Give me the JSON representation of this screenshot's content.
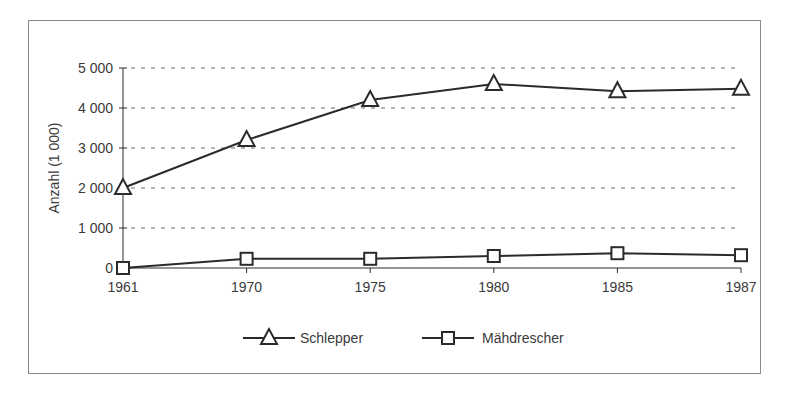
{
  "chart_data": {
    "type": "line",
    "title": "",
    "xlabel": "",
    "ylabel": "Anzahl (1 000)",
    "categories": [
      "1961",
      "1970",
      "1975",
      "1980",
      "1985",
      "1987"
    ],
    "series": [
      {
        "name": "Schlepper",
        "marker": "triangle",
        "values": [
          2000,
          3200,
          4200,
          4600,
          4420,
          4480
        ]
      },
      {
        "name": "Mähdrescher",
        "marker": "square",
        "values": [
          0,
          230,
          230,
          300,
          370,
          320
        ]
      }
    ],
    "yticks": [
      0,
      1000,
      2000,
      3000,
      4000,
      5000
    ],
    "ytick_labels": [
      "0",
      "1 000",
      "2 000",
      "3 000",
      "4 000",
      "5 000"
    ],
    "ylim": [
      0,
      5000
    ],
    "grid": "horizontal-dashed",
    "legend_position": "bottom",
    "colors": {
      "line": "#2b2b2b",
      "grid": "#6a6a6a",
      "frame": "#8a8a8a",
      "text": "#3a3a3a"
    }
  }
}
